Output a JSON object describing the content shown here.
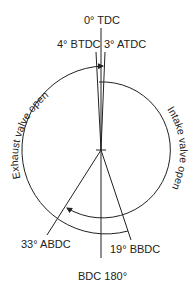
{
  "labels": {
    "tdc": "0° TDC",
    "btdc": "4° BTDC",
    "atdc": "3° ATDC",
    "abdc": "33° ABDC",
    "bbdc": "19° BBDC",
    "bdc": "BDC 180°"
  },
  "arcs": {
    "exhaust": "Exhaust valve open",
    "intake": "Intake valve open"
  },
  "colors": {
    "line": "#222222",
    "background": "#ffffff"
  }
}
